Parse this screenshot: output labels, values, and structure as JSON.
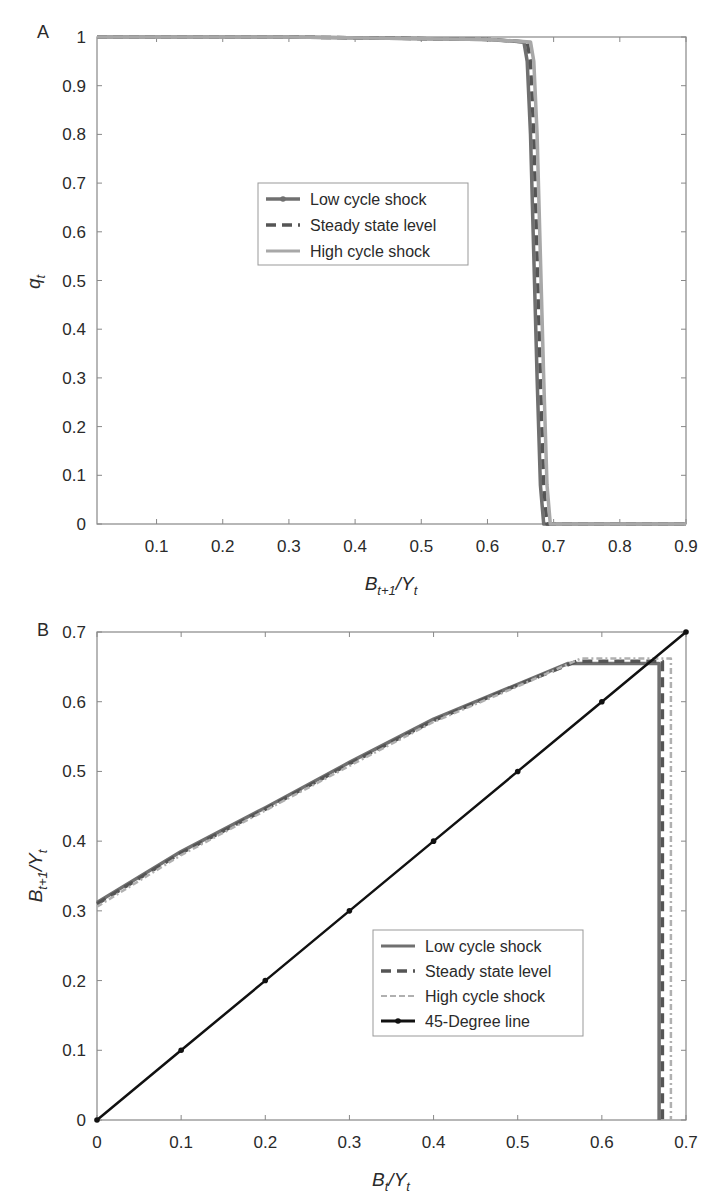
{
  "chart_data": [
    {
      "panel": "A",
      "type": "line",
      "title": "",
      "xlabel": "B_{t+1}/Y_t",
      "ylabel": "q_t",
      "xlim": [
        0.01,
        0.9
      ],
      "ylim": [
        0,
        1
      ],
      "xticks": [
        "0.1",
        "0.2",
        "0.3",
        "0.4",
        "0.5",
        "0.6",
        "0.7",
        "0.8",
        "0.9"
      ],
      "yticks": [
        "0",
        "0.1",
        "0.2",
        "0.3",
        "0.4",
        "0.5",
        "0.6",
        "0.7",
        "0.8",
        "0.9",
        "1"
      ],
      "grid": false,
      "legend_position": "center",
      "series": [
        {
          "name": "Low cycle shock",
          "style": "solid-marker",
          "color": "#707070",
          "x": [
            0.01,
            0.3,
            0.6,
            0.655,
            0.66,
            0.665,
            0.67,
            0.675,
            0.68,
            0.685,
            0.9
          ],
          "y": [
            1.0,
            1.0,
            0.995,
            0.99,
            0.95,
            0.8,
            0.55,
            0.3,
            0.08,
            0.0,
            0.0
          ]
        },
        {
          "name": "Steady state level",
          "style": "dashed",
          "color": "#555555",
          "x": [
            0.01,
            0.3,
            0.6,
            0.66,
            0.665,
            0.67,
            0.675,
            0.68,
            0.685,
            0.69,
            0.9
          ],
          "y": [
            1.0,
            1.0,
            0.995,
            0.99,
            0.95,
            0.8,
            0.55,
            0.3,
            0.08,
            0.0,
            0.0
          ]
        },
        {
          "name": "High cycle shock",
          "style": "solid",
          "color": "#a8a8a8",
          "x": [
            0.01,
            0.3,
            0.6,
            0.665,
            0.67,
            0.675,
            0.68,
            0.685,
            0.69,
            0.695,
            0.9
          ],
          "y": [
            1.0,
            1.0,
            0.995,
            0.99,
            0.95,
            0.8,
            0.55,
            0.3,
            0.08,
            0.0,
            0.0
          ]
        }
      ]
    },
    {
      "panel": "B",
      "type": "line",
      "title": "",
      "xlabel": "B_t/Y_t",
      "ylabel": "B_{t+1}/Y_t",
      "xlim": [
        0,
        0.7
      ],
      "ylim": [
        0,
        0.7
      ],
      "xticks": [
        "0",
        "0.1",
        "0.2",
        "0.3",
        "0.4",
        "0.5",
        "0.6",
        "0.7"
      ],
      "yticks": [
        "0",
        "0.1",
        "0.2",
        "0.3",
        "0.4",
        "0.5",
        "0.6",
        "0.7"
      ],
      "grid": false,
      "legend_position": "lower right",
      "series": [
        {
          "name": "Low cycle shock",
          "style": "solid",
          "color": "#707070",
          "x": [
            0,
            0.1,
            0.2,
            0.3,
            0.4,
            0.5,
            0.56,
            0.665,
            0.668,
            0.668
          ],
          "y": [
            0.312,
            0.385,
            0.448,
            0.513,
            0.575,
            0.625,
            0.655,
            0.655,
            0.655,
            0.0
          ]
        },
        {
          "name": "Steady state level",
          "style": "dashed",
          "color": "#555555",
          "x": [
            0,
            0.1,
            0.2,
            0.3,
            0.4,
            0.5,
            0.57,
            0.67,
            0.672,
            0.672
          ],
          "y": [
            0.31,
            0.383,
            0.446,
            0.511,
            0.573,
            0.624,
            0.658,
            0.658,
            0.658,
            0.0
          ]
        },
        {
          "name": "High cycle shock",
          "style": "dash-dot",
          "color": "#b0b0b0",
          "x": [
            0,
            0.1,
            0.2,
            0.3,
            0.4,
            0.5,
            0.575,
            0.68,
            0.682,
            0.682
          ],
          "y": [
            0.306,
            0.38,
            0.444,
            0.508,
            0.571,
            0.622,
            0.662,
            0.662,
            0.662,
            0.0
          ]
        },
        {
          "name": "45-Degree line",
          "style": "solid-marker",
          "color": "#111111",
          "x": [
            0,
            0.1,
            0.2,
            0.3,
            0.4,
            0.5,
            0.6,
            0.7
          ],
          "y": [
            0,
            0.1,
            0.2,
            0.3,
            0.4,
            0.5,
            0.6,
            0.7
          ]
        }
      ]
    }
  ],
  "labels": {
    "panelA": "A",
    "panelB": "B",
    "A_ylabel_main": "q",
    "A_ylabel_sub": "t",
    "A_xlabel_main1": "B",
    "A_xlabel_sub1": "t+1",
    "A_xlabel_main2": "/Y",
    "A_xlabel_sub2": "t",
    "B_ylabel_main1": "B",
    "B_ylabel_sub1": "t+1",
    "B_ylabel_main2": "/Y",
    "B_ylabel_sub2": "t",
    "B_xlabel_main1": "B",
    "B_xlabel_sub1": "t",
    "B_xlabel_main2": "/Y",
    "B_xlabel_sub2": "t"
  }
}
